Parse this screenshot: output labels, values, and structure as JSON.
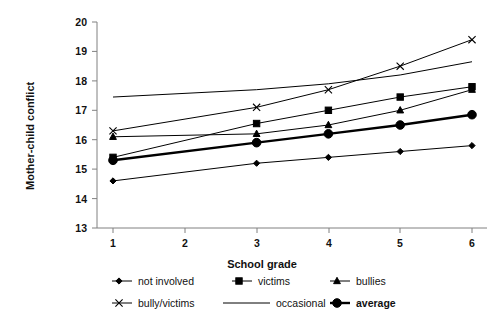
{
  "chart_data": {
    "type": "line",
    "title": "",
    "xlabel": "School grade",
    "ylabel": "Mother-child conflict",
    "x": [
      1,
      3,
      4,
      5,
      6
    ],
    "xticks": [
      1,
      2,
      3,
      4,
      5,
      6
    ],
    "xlim": [
      0.65,
      6.35
    ],
    "ylim": [
      13,
      20
    ],
    "yticks": [
      13,
      14,
      15,
      16,
      17,
      18,
      19,
      20
    ],
    "grid": false,
    "legend_position": "bottom",
    "series": [
      {
        "name": "not involved",
        "marker": "diamond",
        "values": [
          14.6,
          15.2,
          15.4,
          15.6,
          15.8
        ]
      },
      {
        "name": "victims",
        "marker": "square",
        "values": [
          15.4,
          16.55,
          17.0,
          17.45,
          17.8
        ]
      },
      {
        "name": "bullies",
        "marker": "triangle",
        "values": [
          16.1,
          16.2,
          16.5,
          17.0,
          17.7
        ]
      },
      {
        "name": "bully/victims",
        "marker": "x",
        "values": [
          16.3,
          17.1,
          17.7,
          18.5,
          19.4
        ]
      },
      {
        "name": "occasional",
        "marker": "none",
        "values": [
          17.45,
          17.7,
          17.9,
          18.2,
          18.65
        ]
      },
      {
        "name": "average",
        "marker": "circle",
        "emphasis": true,
        "values": [
          15.3,
          15.9,
          16.2,
          16.5,
          16.85
        ]
      }
    ]
  },
  "axes": {
    "y_title": "Mother-child conflict",
    "x_title": "School grade",
    "y_tick_labels": [
      "20",
      "19",
      "18",
      "17",
      "16",
      "15",
      "14",
      "13"
    ],
    "x_tick_labels": [
      "1",
      "2",
      "3",
      "4",
      "5",
      "6"
    ]
  },
  "legend": {
    "rows": [
      [
        {
          "label": "not involved",
          "marker": "diamond"
        },
        {
          "label": "victims",
          "marker": "square"
        },
        {
          "label": "bullies",
          "marker": "triangle"
        }
      ],
      [
        {
          "label": "bully/victims",
          "marker": "x"
        },
        {
          "label": "occasional",
          "marker": "none"
        },
        {
          "label": "average",
          "marker": "circle"
        }
      ]
    ]
  },
  "colors": {
    "line": "#000000",
    "axis": "#808080",
    "text": "#111111",
    "background": "#ffffff"
  }
}
